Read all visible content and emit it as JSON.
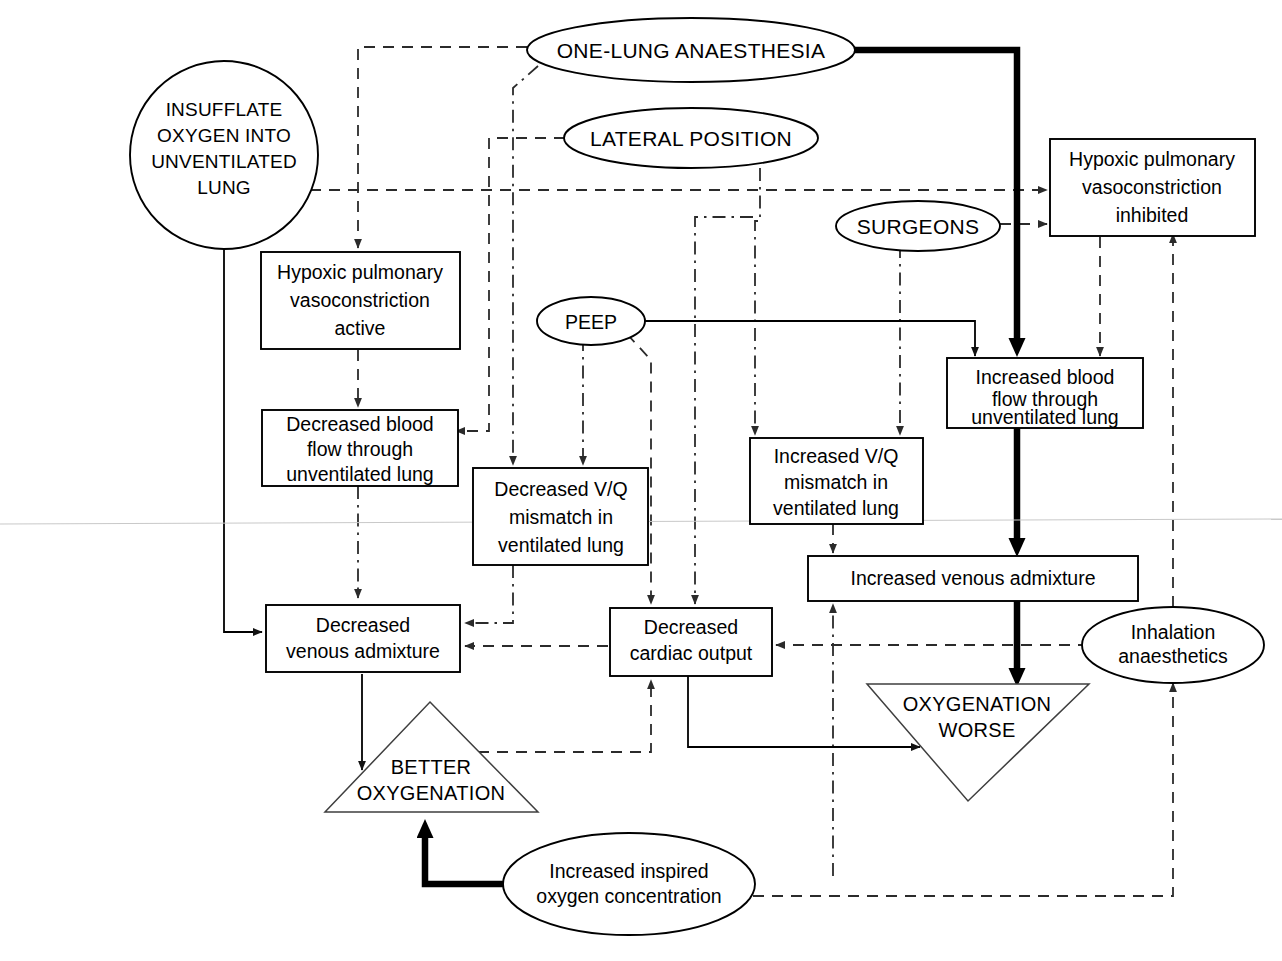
{
  "diagram": {
    "nodes": {
      "insufflate": "INSUFFLATE\nOXYGEN INTO\nUNVENTILATED\nLUNG",
      "insufflate_l1": "INSUFFLATE",
      "insufflate_l2": "OXYGEN INTO",
      "insufflate_l3": "UNVENTILATED",
      "insufflate_l4": "LUNG",
      "one_lung": "ONE-LUNG ANAESTHESIA",
      "lateral": "LATERAL POSITION",
      "surgeons": "SURGEONS",
      "peep": "PEEP",
      "inhalation_l1": "Inhalation",
      "inhalation_l2": "anaesthetics",
      "inspired_l1": "Increased inspired",
      "inspired_l2": "oxygen concentration",
      "hpv_active_l1": "Hypoxic pulmonary",
      "hpv_active_l2": "vasoconstriction",
      "hpv_active_l3": "active",
      "hpv_inhib_l1": "Hypoxic pulmonary",
      "hpv_inhib_l2": "vasoconstriction",
      "hpv_inhib_l3": "inhibited",
      "dec_flow_l1": "Decreased blood",
      "dec_flow_l2": "flow through",
      "dec_flow_l3": "unventilated lung",
      "inc_flow_l1": "Increased blood",
      "inc_flow_l2": "flow through",
      "inc_flow_l3": "unventilated lung",
      "dec_vq_l1": "Decreased V/Q",
      "dec_vq_l2": "mismatch in",
      "dec_vq_l3": "ventilated lung",
      "inc_vq_l1": "Increased V/Q",
      "inc_vq_l2": "mismatch in",
      "inc_vq_l3": "ventilated lung",
      "dec_ven_l1": "Decreased",
      "dec_ven_l2": "venous admixture",
      "inc_ven": "Increased venous admixture",
      "dec_co_l1": "Decreased",
      "dec_co_l2": "cardiac output",
      "better_l1": "BETTER",
      "better_l2": "OXYGENATION",
      "worse_l1": "OXYGENATION",
      "worse_l2": "WORSE"
    },
    "colors": {
      "stroke": "#000000",
      "background": "#ffffff",
      "dash_stroke": "#2b2b2b",
      "thin_stroke": "#3f3f3f"
    }
  }
}
